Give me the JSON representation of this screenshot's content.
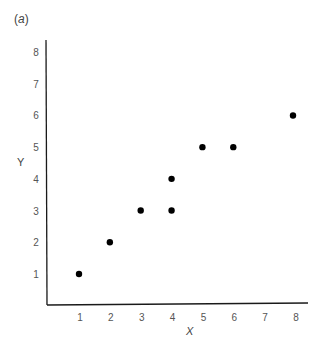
{
  "panel": {
    "label_open": "(",
    "label_letter": "a",
    "label_close": ")"
  },
  "chart_data": {
    "type": "scatter",
    "title": "(a)",
    "xlabel": "X",
    "ylabel": "Y",
    "xlim": [
      0,
      8.5
    ],
    "ylim": [
      0,
      8.5
    ],
    "xticks": [
      1,
      2,
      3,
      4,
      5,
      6,
      7,
      8
    ],
    "yticks": [
      1,
      2,
      3,
      4,
      5,
      6,
      7,
      8
    ],
    "grid": false,
    "legend": null,
    "points": [
      {
        "x": 1,
        "y": 1
      },
      {
        "x": 2,
        "y": 2
      },
      {
        "x": 3,
        "y": 3
      },
      {
        "x": 4,
        "y": 3
      },
      {
        "x": 4,
        "y": 4
      },
      {
        "x": 5,
        "y": 5
      },
      {
        "x": 6,
        "y": 5
      },
      {
        "x": 8,
        "y": 6
      }
    ],
    "marker_color": "#000000",
    "axis_color": "#1a1a1a"
  }
}
